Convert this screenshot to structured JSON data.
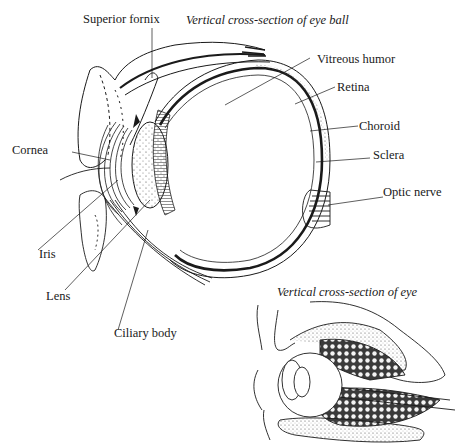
{
  "figure": {
    "main": {
      "title": "Vertical cross-section of eye ball",
      "labels": {
        "superior_fornix": "Superior fornix",
        "vitreous_humor": "Vitreous humor",
        "retina": "Retina",
        "choroid": "Choroid",
        "sclera": "Sclera",
        "optic_nerve": "Optic nerve",
        "cornea": "Cornea",
        "iris": "Iris",
        "lens": "Lens",
        "ciliary_body": "Ciliary body"
      }
    },
    "inset": {
      "title": "Vertical cross-section of eye"
    }
  }
}
